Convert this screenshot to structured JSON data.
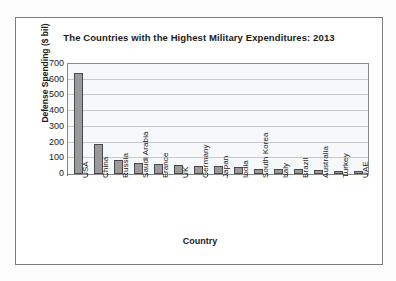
{
  "chart_data": {
    "type": "bar",
    "title": "The Countries with the Highest Military Expenditures: 2013",
    "xlabel": "Country",
    "ylabel": "Defense Spending ($ bil)",
    "categories": [
      "USA",
      "China",
      "Russia",
      "Saudi Arabia",
      "France",
      "UK",
      "Germany",
      "Japan",
      "India",
      "South Korea",
      "Italy",
      "Brazil",
      "Australia",
      "Turkey",
      "UAE"
    ],
    "values": [
      640,
      188,
      88,
      67,
      61,
      58,
      49,
      49,
      47,
      34,
      33,
      31,
      24,
      19,
      19
    ],
    "ylim": [
      0,
      700
    ],
    "yticks": [
      0,
      100,
      200,
      300,
      400,
      500,
      600,
      700
    ],
    "ytick_labels": [
      "0",
      "100",
      "200",
      "300",
      "400",
      "500",
      "600",
      "700"
    ],
    "grid": true,
    "legend": false,
    "bar_color": "#9a9a9a",
    "bar_border_color": "#4a4a4a",
    "plot_background": "#f7f8fa",
    "gridline_color": "#c9c9cd",
    "frame_color": "#7c7c7c"
  }
}
